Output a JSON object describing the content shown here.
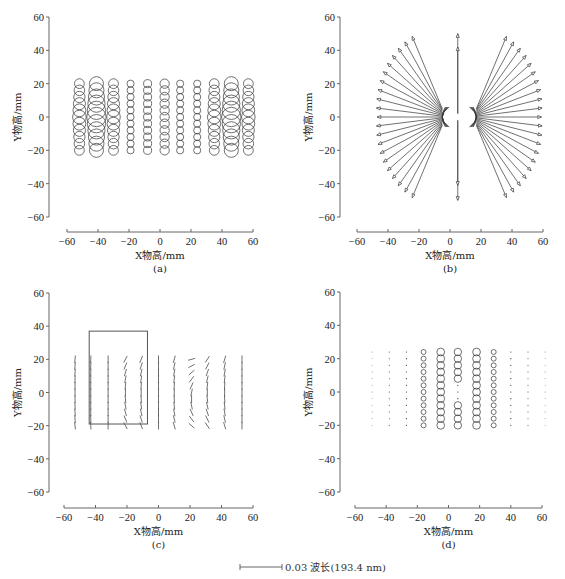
{
  "panels": [
    {
      "id": "a",
      "caption": "(a)",
      "xlabel": "X物高/mm",
      "ylabel": "Y物高/mm",
      "origin": [
        0,
        0
      ],
      "plot": {
        "ox": 49,
        "x_axis_y": 232,
        "xmin_px": 67,
        "xmax_px": 253,
        "ymax_px": 17,
        "ymin_px": 217
      }
    },
    {
      "id": "b",
      "caption": "(b)",
      "xlabel": "X物高/mm",
      "ylabel": "Y物高/mm",
      "origin": [
        0,
        0
      ],
      "plot": {
        "ox": 340,
        "x_axis_y": 232,
        "xmin_px": 357,
        "xmax_px": 543,
        "ymax_px": 17,
        "ymin_px": 217
      }
    },
    {
      "id": "c",
      "caption": "(c)",
      "xlabel": "X物高/mm",
      "ylabel": "Y物高/mm",
      "origin": [
        0,
        0
      ],
      "plot": {
        "ox": 49,
        "x_axis_y": 508,
        "xmin_px": 64,
        "xmax_px": 253,
        "ymax_px": 293,
        "ymin_px": 492
      }
    },
    {
      "id": "d",
      "caption": "(d)",
      "xlabel": "X物高/mm",
      "ylabel": "Y物高/mm",
      "origin": [
        0,
        0
      ],
      "plot": {
        "ox": 340,
        "x_axis_y": 508,
        "xmin_px": 355,
        "xmax_px": 542,
        "ymax_px": 292,
        "ymin_px": 492
      }
    }
  ],
  "ticks": {
    "x": [
      -60,
      -40,
      -20,
      0,
      20,
      40,
      60
    ],
    "y": [
      60,
      40,
      20,
      0,
      -20,
      -40,
      -60
    ]
  },
  "scale_bar": {
    "label": "0.03 波长(193.4 nm)"
  },
  "chart_data": [
    {
      "type": "scatter",
      "title": "(a)",
      "xlabel": "X物高/mm",
      "ylabel": "Y物高/mm",
      "xlim": [
        -60,
        60
      ],
      "ylim": [
        -60,
        60
      ],
      "grid": false,
      "description": "Field map of circles (RMS wavefront magnitude) over 11 columns x 11 rows, Y from -20 to 20",
      "columns_x": [
        -52,
        -41,
        -30,
        -19,
        -8,
        3,
        13,
        24,
        35,
        46,
        57
      ],
      "rows_y": [
        20,
        16,
        12,
        8,
        4,
        0,
        -4,
        -8,
        -12,
        -16,
        -20
      ],
      "relative_radius_by_column": [
        3.5,
        5.0,
        3.5,
        2.3,
        2.6,
        3.0,
        2.3,
        2.3,
        3.5,
        5.0,
        3.5
      ]
    },
    {
      "type": "scatter",
      "title": "(b)",
      "xlabel": "X物高/mm",
      "ylabel": "Y物高/mm",
      "xlim": [
        -60,
        60
      ],
      "ylim": [
        -60,
        60
      ],
      "grid": false,
      "description": "Radial arrow vector field fanning out from two arcs near x=-5 and x=17, plus a vertical axis of arrows at x=5 from -50 to 50"
    },
    {
      "type": "scatter",
      "title": "(c)",
      "xlabel": "X物高/mm",
      "ylabel": "Y物高/mm",
      "xlim": [
        -60,
        60
      ],
      "ylim": [
        -60,
        60
      ],
      "grid": false,
      "description": "Line-segment orientation field, 11 columns x ~11 rows; highlighted rectangle from x=-44 to -7, y=-19 to 37",
      "columns_x": [
        -53,
        -43,
        -32,
        -21,
        -11,
        0,
        10,
        21,
        31,
        42,
        53
      ],
      "rows_y": [
        20,
        16,
        12,
        8,
        4,
        0,
        -4,
        -8,
        -12,
        -16,
        -20
      ],
      "highlight_box": {
        "x0": -44,
        "x1": -7,
        "y0": -19,
        "y1": 37
      }
    },
    {
      "type": "scatter",
      "title": "(d)",
      "xlabel": "X物高/mm",
      "ylabel": "Y物高/mm",
      "xlim": [
        -60,
        60
      ],
      "ylim": [
        -60,
        60
      ],
      "grid": false,
      "description": "Circle size map 12 columns x 11 rows; large circles near x=-5, 6, 18; medium at -16, 29; dots elsewhere",
      "columns_x": [
        -49,
        -38,
        -27,
        -16,
        -5,
        6,
        18,
        29,
        40,
        51,
        62
      ],
      "rows_y": [
        24,
        20,
        16,
        12,
        8,
        4,
        0,
        -4,
        -8,
        -12,
        -16,
        -20
      ]
    }
  ]
}
